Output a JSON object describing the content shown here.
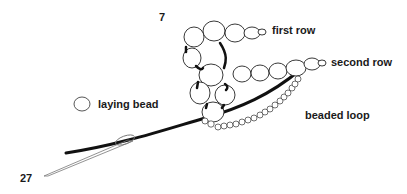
{
  "figure": {
    "top_number": "7",
    "bottom_number": "27"
  },
  "labels": {
    "first_row": "first row",
    "second_row": "second row",
    "beaded_loop": "beaded loop",
    "laying_bead": "laying bead"
  },
  "colors": {
    "background": "#ffffff",
    "ink": "#111111",
    "bead_fill": "#ffffff",
    "bead_stroke": "#222222",
    "needle": "#666666"
  }
}
